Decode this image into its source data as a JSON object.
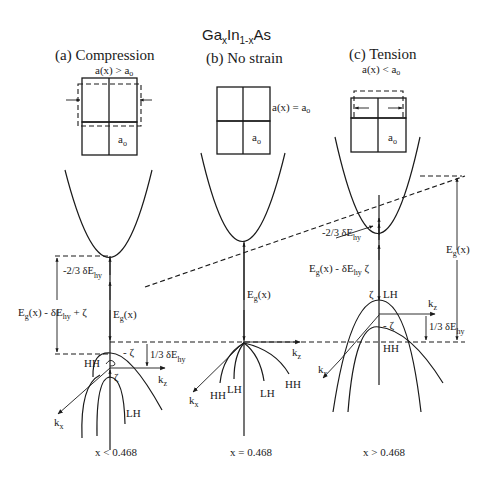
{
  "title": {
    "main": "Ga",
    "sub_x1": "x",
    "mid": "In",
    "sub_1x": "1-x",
    "end": "As"
  },
  "panels": [
    {
      "id": "a",
      "heading": "(a) Compression",
      "lattice_condition": "a(x) > a",
      "lattice_condition_sub": "o",
      "cell_label": "a",
      "cell_label_sub": "o",
      "composition": "x < 0.468",
      "labels": {
        "shift_cb": "-2/3 δE",
        "shift_cb_sub": "hy",
        "total_gap": "E",
        "total_gap_sub": "g",
        "total_gap_rest": "(x) - δE",
        "total_gap_rest_sub": "hy",
        "total_gap_end": " + ζ",
        "gap": "E",
        "gap_sub": "g",
        "gap_rest": "(x)",
        "zeta_minus": "- ζ",
        "zeta": "ζ",
        "shift_vb": "1/3 δE",
        "shift_vb_sub": "hy",
        "hh": "HH",
        "lh": "LH",
        "kz": "k",
        "kz_sub": "z",
        "kx": "k",
        "kx_sub": "x"
      }
    },
    {
      "id": "b",
      "heading": "(b) No strain",
      "lattice_condition": "a(x) = a",
      "lattice_condition_sub": "o",
      "cell_label": "a",
      "cell_label_sub": "o",
      "composition": "x = 0.468",
      "labels": {
        "gap": "E",
        "gap_sub": "g",
        "gap_rest": "(x)",
        "hh_left": "HH",
        "lh_left": "LH",
        "lh_right": "LH",
        "hh_right": "HH",
        "kz": "k",
        "kz_sub": "z",
        "kx": "k",
        "kx_sub": "x"
      }
    },
    {
      "id": "c",
      "heading": "(c) Tension",
      "lattice_condition": "a(x) < a",
      "lattice_condition_sub": "o",
      "cell_label": "a",
      "cell_label_sub": "o",
      "composition": "x > 0.468",
      "labels": {
        "shift_cb": "-2/3 δE",
        "shift_cb_sub": "hy",
        "total_gap": "E",
        "total_gap_sub": "g",
        "total_gap_rest": "(x) - δE",
        "total_gap_rest_sub": "hy",
        "total_gap_end": " ζ",
        "gap": "E",
        "gap_sub": "g",
        "gap_rest": "(x)",
        "zeta": "ζ",
        "zeta_minus": "- ζ",
        "shift_vb": "1/3 δE",
        "shift_vb_sub": "hy",
        "hh": "HH",
        "lh": "LH",
        "kz": "k",
        "kz_sub": "z",
        "kx": "k",
        "kx_sub": "x"
      }
    }
  ],
  "colors": {
    "ink": "#1a1a1a",
    "background": "#ffffff"
  }
}
